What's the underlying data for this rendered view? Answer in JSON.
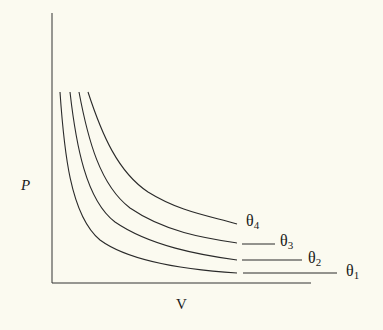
{
  "diagram": {
    "type": "isotherm-pv-diagram",
    "axes": {
      "y_label": "P",
      "x_label": "V"
    },
    "curves": [
      {
        "id": "theta1",
        "symbol": "θ",
        "subscript": "1",
        "label_pos": [
          346,
          263
        ]
      },
      {
        "id": "theta2",
        "symbol": "θ",
        "subscript": "2",
        "label_pos": [
          308,
          250
        ]
      },
      {
        "id": "theta3",
        "symbol": "θ",
        "subscript": "3",
        "label_pos": [
          280,
          233
        ]
      },
      {
        "id": "theta4",
        "symbol": "θ",
        "subscript": "4",
        "label_pos": [
          246,
          213
        ]
      }
    ],
    "colors": {
      "background": "#fbfaf0",
      "line": "#2a2a2a"
    }
  }
}
